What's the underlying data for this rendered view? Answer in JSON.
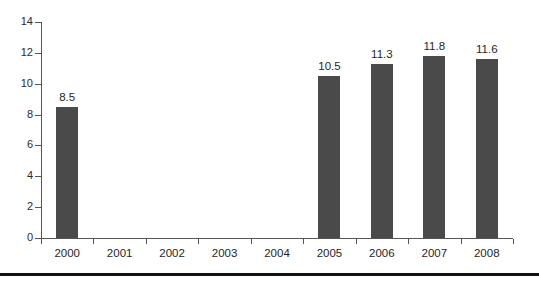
{
  "chart_data": {
    "type": "bar",
    "title": "",
    "subtitle": "",
    "xlabel": "",
    "ylabel": "",
    "categories": [
      "2000",
      "2001",
      "2002",
      "2003",
      "2004",
      "2005",
      "2006",
      "2007",
      "2008"
    ],
    "values": [
      8.5,
      null,
      null,
      null,
      null,
      10.5,
      11.3,
      11.8,
      11.6
    ],
    "data_labels": [
      "8.5",
      "",
      "",
      "",
      "",
      "10.5",
      "11.3",
      "11.8",
      "11.6"
    ],
    "series": [
      {
        "name": "",
        "values": [
          8.5,
          null,
          null,
          null,
          null,
          10.5,
          11.3,
          11.8,
          11.6
        ]
      }
    ],
    "ylim": [
      0,
      14
    ],
    "yticks": [
      0,
      2,
      4,
      6,
      8,
      10,
      12,
      14
    ],
    "ytick_labels": [
      "0",
      "2",
      "4",
      "6",
      "8",
      "10",
      "12",
      "14"
    ],
    "grid": false,
    "legend": false,
    "legend_position": "none",
    "bar_color": "#4a4a4a",
    "axis_color": "#555555",
    "background_color": "#ffffff",
    "missing_categories": [
      "2001",
      "2002",
      "2003",
      "2004"
    ]
  }
}
